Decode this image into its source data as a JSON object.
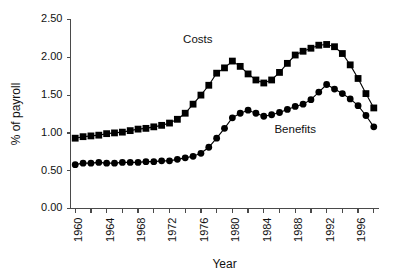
{
  "chart_data": {
    "type": "line",
    "title": "",
    "subtitle": "",
    "xlabel": "Year",
    "ylabel": "% of payroll",
    "xlim": [
      1959.4,
      1998.6
    ],
    "ylim": [
      0.0,
      2.5
    ],
    "grid": false,
    "legend_position": "inline-annotation",
    "ytick_labels": [
      "0.00",
      "0.50",
      "1.00",
      "1.50",
      "2.00",
      "2.50"
    ],
    "ytick_values": [
      0.0,
      0.5,
      1.0,
      1.5,
      2.0,
      2.5
    ],
    "xtick_labels": [
      "1960",
      "1964",
      "1968",
      "1972",
      "1976",
      "1980",
      "1984",
      "1988",
      "1992",
      "1996"
    ],
    "xtick_values": [
      1960,
      1964,
      1968,
      1972,
      1976,
      1980,
      1984,
      1988,
      1992,
      1996
    ],
    "x": [
      1960,
      1961,
      1962,
      1963,
      1964,
      1965,
      1966,
      1967,
      1968,
      1969,
      1970,
      1971,
      1972,
      1973,
      1974,
      1975,
      1976,
      1977,
      1978,
      1979,
      1980,
      1981,
      1982,
      1983,
      1984,
      1985,
      1986,
      1987,
      1988,
      1989,
      1990,
      1991,
      1992,
      1993,
      1994,
      1995,
      1996,
      1997,
      1998
    ],
    "series": [
      {
        "name": "Costs",
        "marker": "square",
        "color": "#000000",
        "annotation": "Costs",
        "values": [
          0.93,
          0.95,
          0.96,
          0.97,
          0.99,
          1.0,
          1.01,
          1.03,
          1.05,
          1.06,
          1.08,
          1.1,
          1.13,
          1.18,
          1.26,
          1.38,
          1.5,
          1.63,
          1.79,
          1.86,
          1.95,
          1.88,
          1.78,
          1.7,
          1.66,
          1.7,
          1.8,
          1.92,
          2.03,
          2.08,
          2.12,
          2.16,
          2.17,
          2.14,
          2.05,
          1.9,
          1.72,
          1.52,
          1.33
        ]
      },
      {
        "name": "Benefits",
        "marker": "circle",
        "color": "#000000",
        "annotation": "Benefits",
        "values": [
          0.58,
          0.6,
          0.6,
          0.61,
          0.6,
          0.6,
          0.61,
          0.61,
          0.61,
          0.62,
          0.62,
          0.63,
          0.63,
          0.65,
          0.67,
          0.69,
          0.73,
          0.81,
          0.93,
          1.06,
          1.2,
          1.26,
          1.3,
          1.26,
          1.22,
          1.24,
          1.27,
          1.31,
          1.35,
          1.38,
          1.44,
          1.54,
          1.64,
          1.58,
          1.52,
          1.45,
          1.36,
          1.23,
          1.08
        ]
      }
    ]
  },
  "annotations": {
    "costs_label": "Costs",
    "benefits_label": "Benefits"
  },
  "axes": {
    "y_title": "% of payroll",
    "x_title": "Year"
  }
}
